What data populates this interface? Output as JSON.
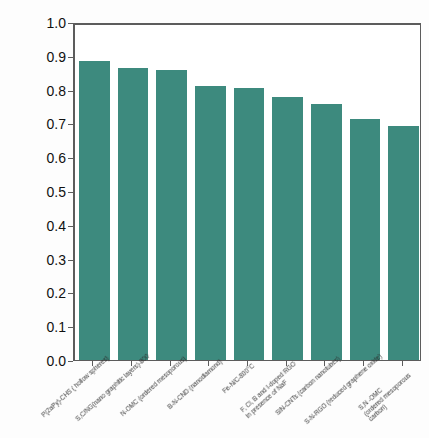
{
  "chart_data": {
    "type": "bar",
    "title": "",
    "xlabel": "",
    "ylabel": "Half-wave potential (V vs RHE)",
    "ylim": [
      0.0,
      1.0
    ],
    "ytick_labels": [
      "1.0",
      "0.9",
      "0.8",
      "0.7",
      "0.6",
      "0.5",
      "0.4",
      "0.3",
      "0.2",
      "0.1",
      "0.0"
    ],
    "ytick_values": [
      1.0,
      0.9,
      0.8,
      0.7,
      0.6,
      0.5,
      0.4,
      0.3,
      0.2,
      0.1,
      0.0
    ],
    "grid": false,
    "legend": "none",
    "bar_color": "#3d8a7e",
    "axis_color": "#5c5c5c",
    "categories": [
      "P(2aPy)-CHS ( hollow spheres)",
      "S,C/NG(nano graphitic layers)-800",
      "N-OMC (ordered mesoporous)",
      "B-N-CND (nanodiamond)",
      "Fe-N/C-800°C",
      "F, Cl, B and I-doped RGO in presence of NaF",
      "SiN-CNTs (carbon nanotubes)",
      "S-N-RGO (reduced graphene oxide)",
      "S,N -OMC (ordered mesoporous carbon)"
    ],
    "category_lines": [
      [
        "P(2aPy)-CHS ( hollow spheres)"
      ],
      [
        "S,C/NG(nano graphitic layers)-800"
      ],
      [
        "N-OMC (ordered mesoporous)"
      ],
      [
        "B-N-CND (nanodiamond)"
      ],
      [
        "Fe-N/C-800°C"
      ],
      [
        "F, Cl, B and I-doped RGO",
        "in presence of NaF"
      ],
      [
        "SiN-CNTs (carbon nanotubes)"
      ],
      [
        "S-N-RGO (reduced graphene oxide)"
      ],
      [
        "S,N -OMC",
        "(ordered mesoporous",
        "carbon)"
      ]
    ],
    "values": [
      0.885,
      0.865,
      0.857,
      0.81,
      0.805,
      0.778,
      0.758,
      0.712,
      0.693
    ]
  }
}
